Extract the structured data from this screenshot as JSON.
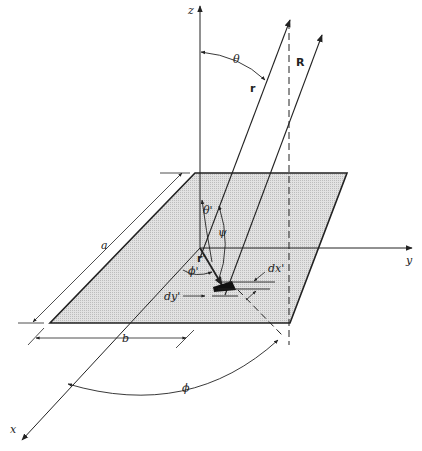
{
  "diagram": {
    "type": "3D geometry of rectangular aperture in xy-plane with radiation vectors",
    "axes": {
      "x": "x",
      "y": "y",
      "z": "z"
    },
    "dimensions": {
      "length_a": "a",
      "width_b": "b",
      "element_dx": "dx'",
      "element_dy": "dy'"
    },
    "vectors": {
      "observation": "r",
      "distance": "R",
      "source": "r'"
    },
    "angles": {
      "theta": "θ",
      "phi": "ϕ",
      "theta_prime": "θ'",
      "phi_prime": "ϕ'",
      "psi": "ψ"
    },
    "colors": {
      "line": "#222222",
      "plate_fill": "#d8d8d8",
      "background": "#ffffff"
    }
  }
}
